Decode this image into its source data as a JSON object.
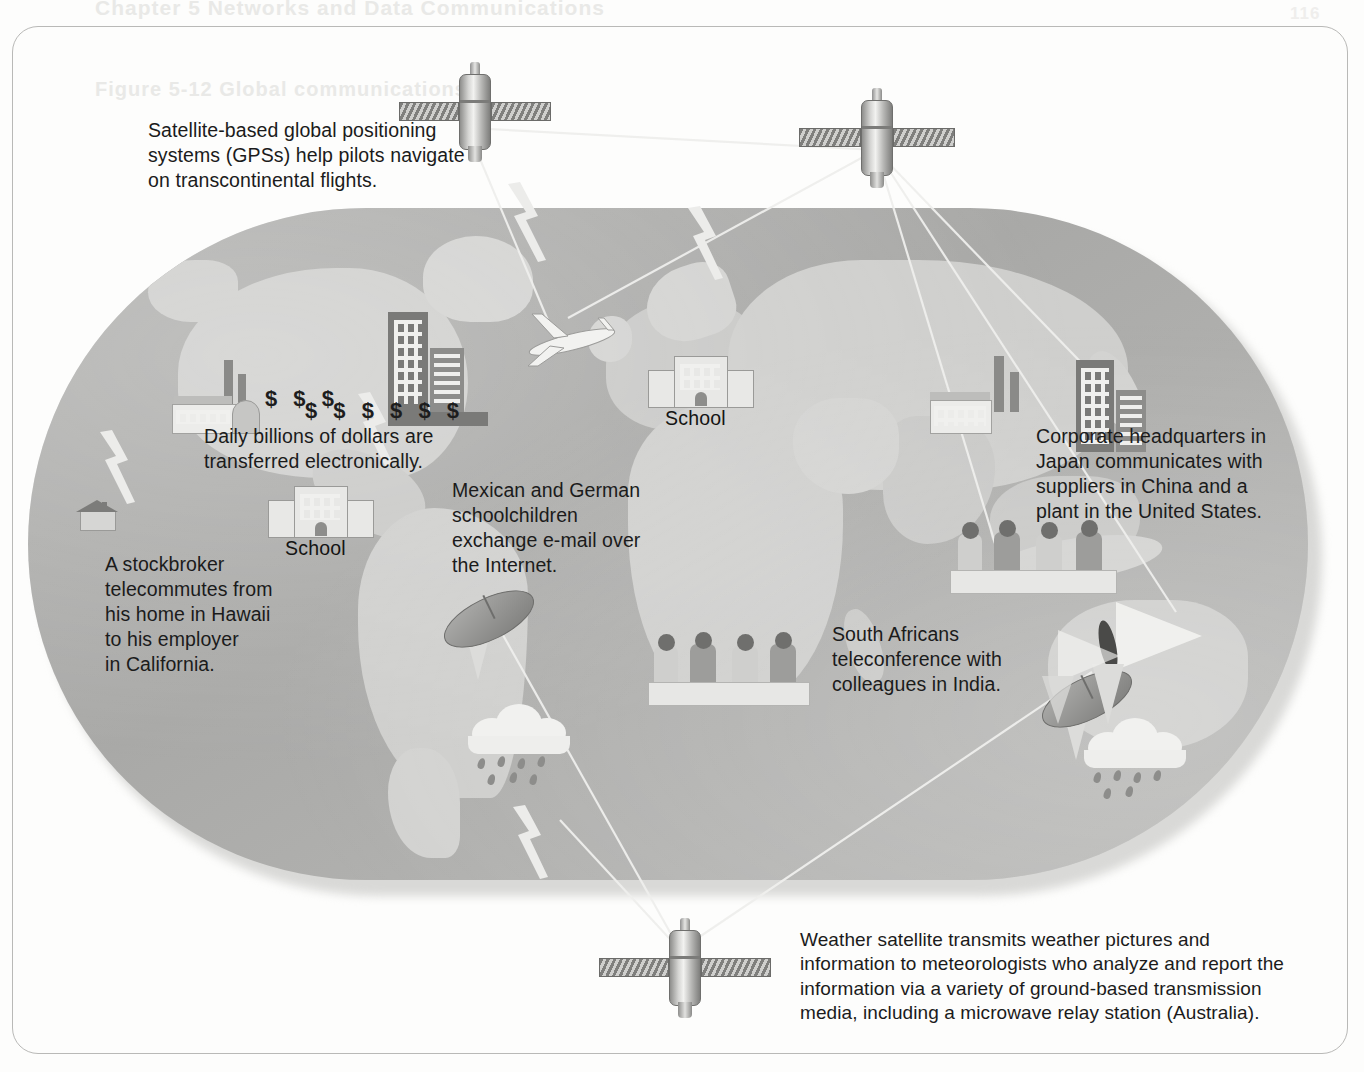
{
  "figure": {
    "type": "annotated-world-map-diagram"
  },
  "ghost_text": {
    "line_a": "Chapter 5    Networks and Data Communications",
    "line_b": "Figure 5-12   Global communications",
    "corner": "116"
  },
  "callouts": [
    {
      "id": "gps",
      "name": "gps-callout",
      "text": "Satellite-based global positioning\nsystems (GPSs) help pilots navigate\non transcontinental flights."
    },
    {
      "id": "money",
      "name": "electronic-funds-callout",
      "text": "Daily billions of dollars are\ntransferred electronically."
    },
    {
      "id": "stockbroker",
      "name": "stockbroker-callout",
      "text": "A stockbroker\ntelecommutes from\nhis home in Hawaii\nto his employer\nin California."
    },
    {
      "id": "email",
      "name": "schoolchildren-email-callout",
      "text": "Mexican and German\nschoolchildren\nexchange e-mail over\nthe Internet."
    },
    {
      "id": "corporate",
      "name": "corporate-hq-callout",
      "text": "Corporate headquarters in\nJapan communicates with\nsuppliers in China and a\nplant in the United States."
    },
    {
      "id": "teleconference",
      "name": "teleconference-callout",
      "text": "South Africans\nteleconference with\ncolleagues in India."
    },
    {
      "id": "weather",
      "name": "weather-satellite-callout",
      "text": "Weather satellite transmits weather pictures and\ninformation to meteorologists who analyze and report the\ninformation via a variety of ground-based transmission\nmedia, including a microwave relay station (Australia)."
    }
  ],
  "map_labels": [
    {
      "name": "school-label-north-america",
      "text": "School"
    },
    {
      "name": "school-label-europe",
      "text": "School"
    }
  ],
  "dollar_symbols": {
    "upper": "$ $ $",
    "lower": "$ $ $ $ $ $"
  },
  "icons": [
    {
      "name": "satellite-gps-icon",
      "label": "GPS satellite"
    },
    {
      "name": "satellite-comms-icon",
      "label": "Communications satellite"
    },
    {
      "name": "satellite-weather-icon",
      "label": "Weather satellite"
    },
    {
      "name": "airplane-icon",
      "label": "Transcontinental airliner"
    },
    {
      "name": "school-building-icon",
      "label": "School building"
    },
    {
      "name": "office-tower-icon",
      "label": "Office towers"
    },
    {
      "name": "factory-icon",
      "label": "Factory / plant"
    },
    {
      "name": "house-icon",
      "label": "Home office"
    },
    {
      "name": "satellite-dish-icon",
      "label": "Ground satellite dish"
    },
    {
      "name": "microwave-relay-icon",
      "label": "Microwave relay station"
    },
    {
      "name": "rain-cloud-icon",
      "label": "Weather cloud with rain"
    },
    {
      "name": "meeting-group-icon",
      "label": "Teleconference participants"
    }
  ],
  "colors": {
    "ocean": "#a9a9a7",
    "land": "#cfcfcd",
    "text": "#1b1b1b",
    "frame": "#b9b9b7",
    "beam": "#ededeb"
  }
}
